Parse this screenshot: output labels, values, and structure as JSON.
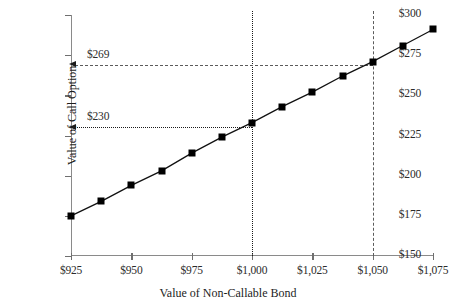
{
  "chart_data": {
    "type": "line",
    "title": "",
    "xlabel": "Value of Non-Callable Bond",
    "ylabel": "Value of Call Option",
    "xlim": [
      925,
      1075
    ],
    "ylim": [
      150,
      300
    ],
    "grid": false,
    "legend": false,
    "x_tick_labels": [
      "$925",
      "$950",
      "$975",
      "$1,000",
      "$1,025",
      "$1,050",
      "$1,075"
    ],
    "x_tick_values": [
      925,
      950,
      975,
      1000,
      1025,
      1050,
      1075
    ],
    "y_tick_labels": [
      "$150",
      "$175",
      "$200",
      "$225",
      "$250",
      "$275",
      "$300"
    ],
    "y_tick_values": [
      150,
      175,
      200,
      225,
      250,
      275,
      300
    ],
    "series": [
      {
        "name": "Value of Call Option",
        "marker": "square",
        "color": "#000000",
        "x": [
          925,
          937.5,
          950,
          962.5,
          975,
          987.5,
          1000,
          1012.5,
          1025,
          1037.5,
          1050,
          1062.5,
          1075
        ],
        "values": [
          175,
          184,
          194,
          203,
          214,
          224,
          233,
          243,
          252,
          262,
          271,
          281,
          291
        ]
      }
    ],
    "annotations": [
      {
        "name": "call-value-at-1050",
        "label": "$269",
        "y_value": 269,
        "x_value": 1050,
        "line_style": "dashed",
        "arrow": "left",
        "color": "#5b5b5b"
      },
      {
        "name": "call-value-at-1000",
        "label": "$230",
        "y_value": 230,
        "x_value": 1000,
        "line_style": "dotted",
        "arrow": "left",
        "color": "#1a1a1a"
      }
    ],
    "reference_lines": [
      {
        "name": "bond-value-1000",
        "axis": "vertical",
        "value": 1000,
        "style": "dotted",
        "color": "#1a1a1a"
      },
      {
        "name": "bond-value-1050",
        "axis": "vertical",
        "value": 1050,
        "style": "dashed",
        "color": "#5b5b5b"
      }
    ]
  }
}
